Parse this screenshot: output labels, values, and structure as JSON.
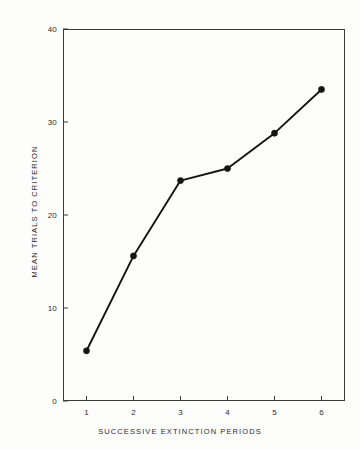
{
  "chart_data": {
    "type": "line",
    "title": "",
    "subtitle": "",
    "xlabel": "SUCCESSIVE EXTINCTION PERIODS",
    "ylabel": "MEAN TRIALS TO CRITERION",
    "x": [
      1,
      2,
      3,
      4,
      5,
      6
    ],
    "values": [
      5.4,
      15.6,
      23.7,
      25.0,
      28.8,
      33.5
    ],
    "series": [
      {
        "name": "Mean trials to criterion",
        "values": [
          5.4,
          15.6,
          23.7,
          25.0,
          28.8,
          33.5
        ]
      }
    ],
    "categories": [
      "1",
      "2",
      "3",
      "4",
      "5",
      "6"
    ],
    "xtick_labels": [
      "1",
      "2",
      "3",
      "4",
      "5",
      "6"
    ],
    "ytick_labels": [
      "0",
      "10",
      "20",
      "30",
      "40"
    ],
    "ytick_values": [
      0,
      10,
      20,
      30,
      40
    ],
    "xlim": [
      0.5,
      6.5
    ],
    "ylim": [
      0,
      40
    ],
    "grid": false,
    "legend": false,
    "legend_position": "none",
    "marker": "filled-circle",
    "line_color": "#141414",
    "marker_color": "#141414",
    "axis_color": "#3a3a3a",
    "background_color": "#fdfdfc",
    "annotations": []
  }
}
